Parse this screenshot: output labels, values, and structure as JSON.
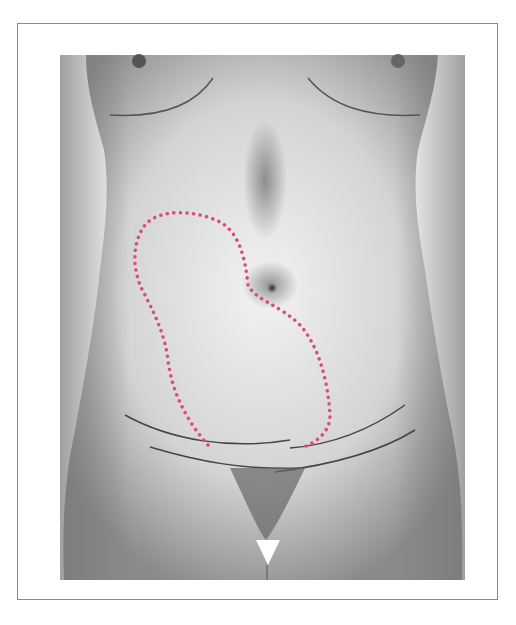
{
  "figure": {
    "annotation": "dotted kidney-shaped outline on abdomen",
    "frame_color": "#e0607e",
    "outline_color": "#d9506e",
    "skin_tone": "grayscale"
  }
}
